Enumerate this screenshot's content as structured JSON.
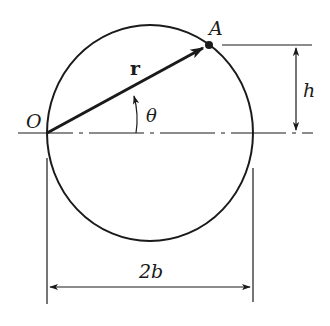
{
  "diagram": {
    "labels": {
      "point_A": "A",
      "origin": "O",
      "vector": "r",
      "angle": "θ",
      "height": "h",
      "width": "2b"
    },
    "colors": {
      "ink": "#1a1a1a",
      "background": "#ffffff"
    }
  }
}
